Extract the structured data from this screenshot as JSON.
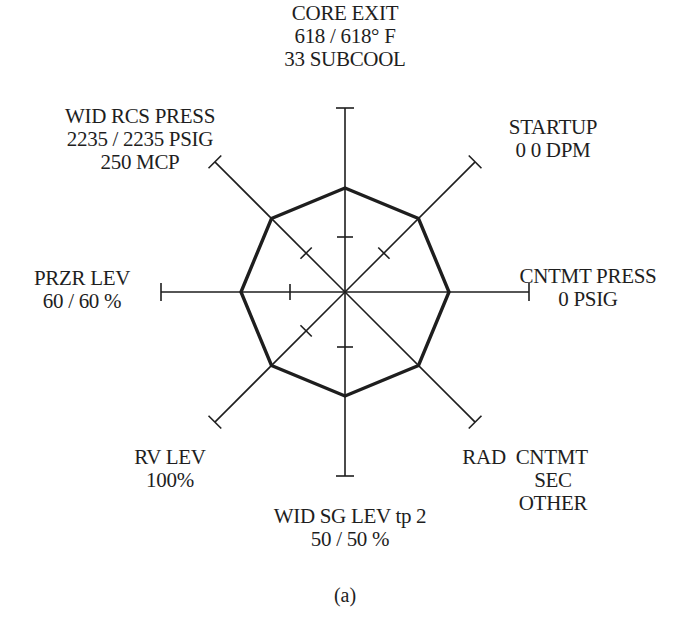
{
  "figure": {
    "caption": "(a)",
    "center": {
      "x": 345,
      "y": 292
    },
    "axis_length": 184,
    "polygon_radius": 104,
    "tick_radius": 55,
    "line_color": "#1e1e1e",
    "polygon_color": "#1e1e1e"
  },
  "axes": [
    {
      "id": "core-exit",
      "angle_deg": 90,
      "has_tick": true,
      "lines": [
        "CORE EXIT",
        "618 / 618° F",
        "33 SUBCOOL"
      ]
    },
    {
      "id": "startup",
      "angle_deg": 45,
      "has_tick": true,
      "lines": [
        "STARTUP",
        "0 0 DPM"
      ]
    },
    {
      "id": "cntmt-press",
      "angle_deg": 0,
      "has_tick": false,
      "lines": [
        "CNTMT PRESS",
        "0 PSIG"
      ]
    },
    {
      "id": "rad",
      "angle_deg": -45,
      "has_tick": false,
      "lines": [
        "RAD  CNTMT",
        "SEC",
        "OTHER"
      ]
    },
    {
      "id": "wid-sg-lev",
      "angle_deg": -90,
      "has_tick": true,
      "lines": [
        "WID SG LEV tp 2",
        "50 / 50 %"
      ]
    },
    {
      "id": "rv-lev",
      "angle_deg": -135,
      "has_tick": true,
      "lines": [
        "RV LEV",
        "100%"
      ]
    },
    {
      "id": "przr-lev",
      "angle_deg": 180,
      "has_tick": true,
      "lines": [
        "PRZR LEV",
        "60 / 60 %"
      ]
    },
    {
      "id": "wid-rcs-press",
      "angle_deg": 135,
      "has_tick": true,
      "lines": [
        "WID RCS PRESS",
        "2235 / 2235 PSIG",
        "250 MCP"
      ]
    }
  ],
  "labels": {
    "core_exit": {
      "l1": "CORE EXIT",
      "l2": "618 / 618° F",
      "l3": "33 SUBCOOL"
    },
    "startup": {
      "l1": "STARTUP",
      "l2": "0 0 DPM"
    },
    "cntmt_press": {
      "l1": "CNTMT PRESS",
      "l2": "0 PSIG"
    },
    "rad": {
      "l1": "RAD  CNTMT",
      "l2": "SEC",
      "l3": "OTHER"
    },
    "wid_sg_lev": {
      "l1": "WID SG LEV tp 2",
      "l2": "50 / 50 %"
    },
    "rv_lev": {
      "l1": "RV LEV",
      "l2": "100%"
    },
    "przr_lev": {
      "l1": "PRZR LEV",
      "l2": "60 / 60 %"
    },
    "wid_rcs_press": {
      "l1": "WID RCS PRESS",
      "l2": "2235 / 2235 PSIG",
      "l3": "250 MCP"
    }
  }
}
